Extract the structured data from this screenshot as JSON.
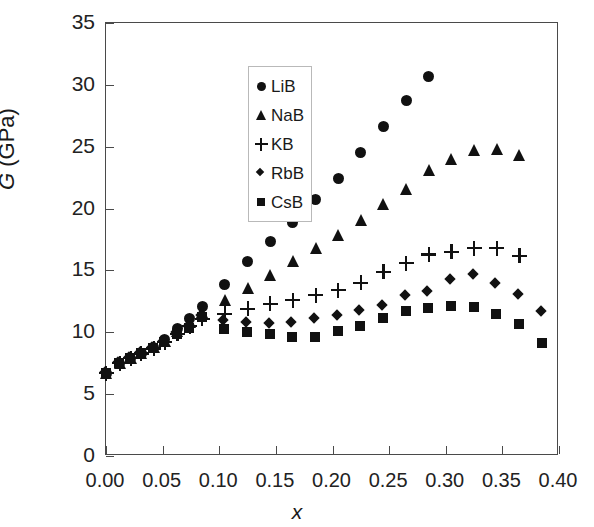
{
  "chart_data": {
    "type": "scatter",
    "title": "",
    "xlabel": "x",
    "ylabel": "G (GPa)",
    "ylabel_italic_part": "G",
    "ylabel_rest": " (GPa)",
    "xlim": [
      0.0,
      0.4
    ],
    "ylim": [
      0,
      35
    ],
    "xticks": [
      0.0,
      0.05,
      0.1,
      0.15,
      0.2,
      0.25,
      0.3,
      0.35,
      0.4
    ],
    "xtick_labels": [
      "0.00",
      "0.05",
      "0.10",
      "0.15",
      "0.20",
      "0.25",
      "0.30",
      "0.35",
      "0.40"
    ],
    "yticks": [
      0,
      5,
      10,
      15,
      20,
      25,
      30,
      35
    ],
    "ytick_labels": [
      "0",
      "5",
      "10",
      "15",
      "20",
      "25",
      "30",
      "35"
    ],
    "grid": false,
    "legend_position": "upper-left-inside",
    "marker_color": "#111111",
    "frame_color": "#4a4a4a",
    "series": [
      {
        "name": "LiB",
        "marker": "circle",
        "points": [
          [
            0.0,
            6.7
          ],
          [
            0.012,
            7.5
          ],
          [
            0.022,
            7.9
          ],
          [
            0.031,
            8.3
          ],
          [
            0.042,
            8.8
          ],
          [
            0.052,
            9.4
          ],
          [
            0.063,
            10.3
          ],
          [
            0.074,
            11.1
          ],
          [
            0.085,
            12.1
          ],
          [
            0.105,
            13.9
          ],
          [
            0.125,
            15.7
          ],
          [
            0.145,
            17.3
          ],
          [
            0.165,
            18.9
          ],
          [
            0.185,
            20.7
          ],
          [
            0.205,
            22.4
          ],
          [
            0.225,
            24.5
          ],
          [
            0.245,
            26.6
          ],
          [
            0.265,
            28.7
          ],
          [
            0.285,
            30.7
          ]
        ]
      },
      {
        "name": "NaB",
        "marker": "triangle",
        "points": [
          [
            0.0,
            6.7
          ],
          [
            0.012,
            7.5
          ],
          [
            0.022,
            7.9
          ],
          [
            0.031,
            8.3
          ],
          [
            0.042,
            8.8
          ],
          [
            0.052,
            9.3
          ],
          [
            0.063,
            10.1
          ],
          [
            0.074,
            10.8
          ],
          [
            0.085,
            11.6
          ],
          [
            0.105,
            12.6
          ],
          [
            0.125,
            13.6
          ],
          [
            0.145,
            14.6
          ],
          [
            0.165,
            15.8
          ],
          [
            0.185,
            16.8
          ],
          [
            0.205,
            17.9
          ],
          [
            0.225,
            19.1
          ],
          [
            0.245,
            20.4
          ],
          [
            0.265,
            21.6
          ],
          [
            0.285,
            23.1
          ],
          [
            0.305,
            24.0
          ],
          [
            0.325,
            24.7
          ],
          [
            0.345,
            24.8
          ],
          [
            0.365,
            24.3
          ]
        ]
      },
      {
        "name": "KB",
        "marker": "plus",
        "points": [
          [
            0.0,
            6.7
          ],
          [
            0.012,
            7.5
          ],
          [
            0.022,
            7.9
          ],
          [
            0.031,
            8.3
          ],
          [
            0.042,
            8.7
          ],
          [
            0.052,
            9.2
          ],
          [
            0.063,
            9.9
          ],
          [
            0.074,
            10.5
          ],
          [
            0.085,
            11.1
          ],
          [
            0.105,
            11.5
          ],
          [
            0.125,
            11.9
          ],
          [
            0.145,
            12.3
          ],
          [
            0.165,
            12.6
          ],
          [
            0.185,
            13.0
          ],
          [
            0.205,
            13.4
          ],
          [
            0.225,
            14.0
          ],
          [
            0.245,
            14.9
          ],
          [
            0.265,
            15.6
          ],
          [
            0.285,
            16.3
          ],
          [
            0.305,
            16.5
          ],
          [
            0.325,
            16.8
          ],
          [
            0.345,
            16.8
          ],
          [
            0.365,
            16.2
          ]
        ]
      },
      {
        "name": "RbB",
        "marker": "diamond",
        "points": [
          [
            0.0,
            6.7
          ],
          [
            0.012,
            7.5
          ],
          [
            0.022,
            7.9
          ],
          [
            0.031,
            8.3
          ],
          [
            0.042,
            8.7
          ],
          [
            0.052,
            9.2
          ],
          [
            0.063,
            9.9
          ],
          [
            0.074,
            10.4
          ],
          [
            0.085,
            11.3
          ],
          [
            0.105,
            10.9
          ],
          [
            0.125,
            10.7
          ],
          [
            0.145,
            10.6
          ],
          [
            0.165,
            10.7
          ],
          [
            0.185,
            11.0
          ],
          [
            0.205,
            11.3
          ],
          [
            0.225,
            11.7
          ],
          [
            0.245,
            12.1
          ],
          [
            0.265,
            12.9
          ],
          [
            0.285,
            13.2
          ],
          [
            0.305,
            14.2
          ],
          [
            0.325,
            14.6
          ],
          [
            0.345,
            13.9
          ],
          [
            0.365,
            13.0
          ],
          [
            0.385,
            11.6
          ]
        ]
      },
      {
        "name": "CsB",
        "marker": "square",
        "points": [
          [
            0.0,
            6.7
          ],
          [
            0.012,
            7.5
          ],
          [
            0.022,
            7.9
          ],
          [
            0.031,
            8.3
          ],
          [
            0.042,
            8.7
          ],
          [
            0.052,
            9.2
          ],
          [
            0.063,
            9.8
          ],
          [
            0.074,
            10.3
          ],
          [
            0.085,
            11.2
          ],
          [
            0.105,
            10.2
          ],
          [
            0.125,
            10.0
          ],
          [
            0.145,
            9.8
          ],
          [
            0.165,
            9.6
          ],
          [
            0.185,
            9.6
          ],
          [
            0.205,
            10.1
          ],
          [
            0.225,
            10.5
          ],
          [
            0.245,
            11.1
          ],
          [
            0.265,
            11.7
          ],
          [
            0.285,
            11.9
          ],
          [
            0.305,
            12.1
          ],
          [
            0.325,
            12.0
          ],
          [
            0.345,
            11.4
          ],
          [
            0.365,
            10.6
          ],
          [
            0.385,
            9.1
          ]
        ]
      }
    ]
  },
  "legend": {
    "items": [
      {
        "label": "LiB",
        "marker": "circle"
      },
      {
        "label": "NaB",
        "marker": "triangle"
      },
      {
        "label": "KB",
        "marker": "plus"
      },
      {
        "label": "RbB",
        "marker": "diamond"
      },
      {
        "label": "CsB",
        "marker": "square"
      }
    ]
  }
}
